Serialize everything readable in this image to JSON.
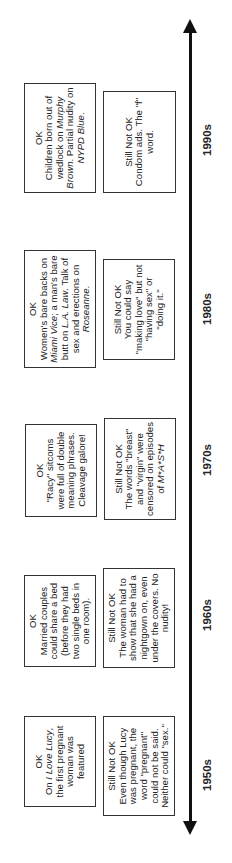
{
  "timeline": {
    "direction": "left-to-right (rotated 90° counter-clockwise on page)",
    "axis": {
      "start_arrow": "arrow-left",
      "end_arrow": "arrow-right"
    },
    "decades": [
      {
        "label": "1950s",
        "ok": {
          "heading": "OK",
          "segments": [
            {
              "text": "On ",
              "italic": false
            },
            {
              "text": "I Love Lucy",
              "italic": true
            },
            {
              "text": ", the first pregnant woman was featured",
              "italic": false
            }
          ]
        },
        "not_ok": {
          "heading": "Still Not OK",
          "segments": [
            {
              "text": "Even though Lucy was pregnant, the word \"pregnant\" could not be said. Neither could \"sex.\"",
              "italic": false
            }
          ]
        }
      },
      {
        "label": "1960s",
        "ok": {
          "heading": "OK",
          "segments": [
            {
              "text": "Married couples could share a bed (before they had two single beds in one room).",
              "italic": false
            }
          ]
        },
        "not_ok": {
          "heading": "Still Not OK",
          "segments": [
            {
              "text": "The woman had to show that she had a nightgown on, even under the covers. No nudity!",
              "italic": false
            }
          ]
        }
      },
      {
        "label": "1970s",
        "ok": {
          "heading": "OK",
          "segments": [
            {
              "text": "\"Racy\" sitcoms were full of double meaning phrases. Cleavage galore!",
              "italic": false
            }
          ]
        },
        "not_ok": {
          "heading": "Still Not OK",
          "segments": [
            {
              "text": "The words \"breast\" and \"virgin\" were censored on episodes of ",
              "italic": false
            },
            {
              "text": "M*A*S*H",
              "italic": true
            }
          ]
        }
      },
      {
        "label": "1980s",
        "ok": {
          "heading": "OK",
          "segments": [
            {
              "text": "Women's bare backs on ",
              "italic": false
            },
            {
              "text": "Miami Vice",
              "italic": true
            },
            {
              "text": "; a man's bare butt on ",
              "italic": false
            },
            {
              "text": "L.A. Law",
              "italic": true
            },
            {
              "text": ". Talk of sex and erections on ",
              "italic": false
            },
            {
              "text": "Roseanne",
              "italic": true
            },
            {
              "text": ".",
              "italic": false
            }
          ]
        },
        "not_ok": {
          "heading": "Still Not OK",
          "segments": [
            {
              "text": "You could say \"making love\" but not \"having sex\" or \"doing it.\"",
              "italic": false
            }
          ]
        }
      },
      {
        "label": "1990s",
        "ok": {
          "heading": "OK",
          "segments": [
            {
              "text": "Children born out of wedlock on ",
              "italic": false
            },
            {
              "text": "Murphy Brown",
              "italic": true
            },
            {
              "text": ". Partial nudity on ",
              "italic": false
            },
            {
              "text": "NYPD Blue",
              "italic": true
            },
            {
              "text": ".",
              "italic": false
            }
          ]
        },
        "not_ok": {
          "heading": "Still Not OK",
          "segments": [
            {
              "text": "Condom ads. The \"f\" word.",
              "italic": false
            }
          ]
        }
      }
    ]
  },
  "colors": {
    "background": "#ffffff",
    "ink": "#111111",
    "box_border": "#333333"
  }
}
